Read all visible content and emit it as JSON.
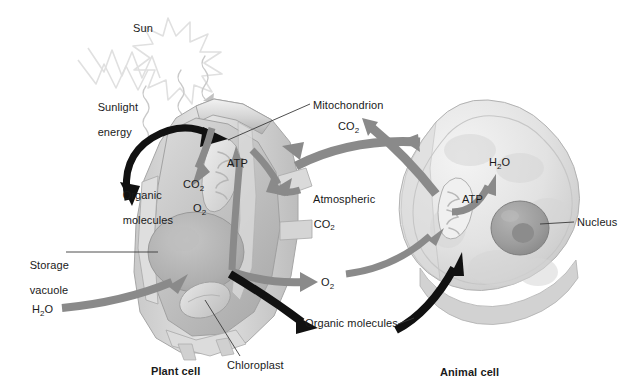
{
  "figure": {
    "title_hidden": "Energy flow between photosynthesis and cellular respiration",
    "sun_label": "Sun",
    "sunlight_label_line1": "Sunlight",
    "sunlight_label_line2": "energy",
    "plant_cell_caption": "Plant cell",
    "animal_cell_caption": "Animal cell"
  },
  "labels": {
    "organic_molecules_left_line1": "Organic",
    "organic_molecules_left_line2": "molecules",
    "co2_plant": "CO",
    "co2_plant_sub": "2",
    "o2_plant": "O",
    "o2_plant_sub": "2",
    "atp_plant": "ATP",
    "mitochondrion": "Mitochondrion",
    "co2_mito": "CO",
    "co2_mito_sub": "2",
    "atmospheric_line1": "Atmospheric",
    "atmospheric_line2": "CO",
    "atmospheric_line2_sub": "2",
    "storage_vacuole_line1": "Storage",
    "storage_vacuole_line2": "vacuole",
    "h2o_plant": "H",
    "h2o_plant_sub": "2",
    "h2o_plant_tail": "O",
    "chloroplast": "Chloroplast",
    "o2_out": "O",
    "o2_out_sub": "2",
    "organic_molecules_right": "Organic molecules",
    "h2o_animal": "H",
    "h2o_animal_sub": "2",
    "h2o_animal_tail": "O",
    "atp_animal": "ATP",
    "nucleus": "Nucleus"
  },
  "colors": {
    "text": "#1a1a1a",
    "gray_arrow": "#8a8a8a",
    "dark_arrow": "#111111",
    "leader_line": "#3a3a3a",
    "cell_light": "#e9e9e9",
    "cell_mid": "#cccccc",
    "cell_dark": "#9a9a9a",
    "sun_outline": "#e2e2e2",
    "background": "#ffffff"
  }
}
